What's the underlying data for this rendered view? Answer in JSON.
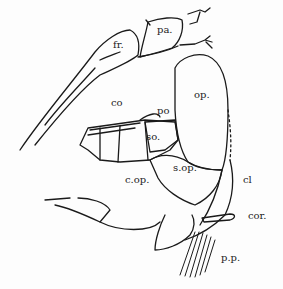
{
  "diagram": {
    "type": "anatomical line drawing (lateral view of fish head bones)",
    "stroke_color": "#1a1a1a",
    "background": "#ffffff",
    "labels": [
      {
        "id": "fr",
        "text": "fr.",
        "x": 113,
        "y": 40
      },
      {
        "id": "pa",
        "text": "pa.",
        "x": 157,
        "y": 25
      },
      {
        "id": "op",
        "text": "op.",
        "x": 194,
        "y": 90
      },
      {
        "id": "co",
        "text": "co",
        "x": 111,
        "y": 98
      },
      {
        "id": "po",
        "text": "po",
        "x": 157,
        "y": 106
      },
      {
        "id": "so",
        "text": "so.",
        "x": 146,
        "y": 132
      },
      {
        "id": "sop",
        "text": "s.op.",
        "x": 173,
        "y": 163
      },
      {
        "id": "cop",
        "text": "c.op.",
        "x": 125,
        "y": 175
      },
      {
        "id": "cl",
        "text": "cl",
        "x": 243,
        "y": 175
      },
      {
        "id": "cor",
        "text": "cor.",
        "x": 248,
        "y": 211
      },
      {
        "id": "pp",
        "text": "p.p.",
        "x": 221,
        "y": 253
      }
    ]
  }
}
